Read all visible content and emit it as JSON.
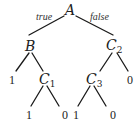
{
  "diagram": {
    "type": "binary-decision-tree",
    "root": "A",
    "edge_labels": [
      {
        "id": "true",
        "text": "true",
        "x": 36,
        "y": 20
      },
      {
        "id": "false",
        "text": "false",
        "x": 90,
        "y": 20
      }
    ],
    "nodes": [
      {
        "id": "A",
        "name": "node-a",
        "letter": "A",
        "sub": "",
        "x": 65,
        "y": 15
      },
      {
        "id": "B",
        "name": "node-b",
        "letter": "B",
        "sub": "",
        "x": 25,
        "y": 51
      },
      {
        "id": "C2",
        "name": "node-c2",
        "letter": "C",
        "sub": "2",
        "x": 106,
        "y": 50
      },
      {
        "id": "C1",
        "name": "node-c1",
        "letter": "C",
        "sub": "1",
        "x": 39,
        "y": 84
      },
      {
        "id": "C3",
        "name": "node-c3",
        "letter": "C",
        "sub": "3",
        "x": 86,
        "y": 84
      }
    ],
    "leaves": [
      {
        "id": "B_true",
        "name": "leaf-b-1",
        "text": "1",
        "x": 9,
        "y": 84
      },
      {
        "id": "C2_false",
        "name": "leaf-c2-0",
        "text": "0",
        "x": 127,
        "y": 84
      },
      {
        "id": "C1_true",
        "name": "leaf-c1-1",
        "text": "1",
        "x": 26,
        "y": 119
      },
      {
        "id": "C1_false",
        "name": "leaf-c1-0",
        "text": "0",
        "x": 62,
        "y": 119
      },
      {
        "id": "C3_true",
        "name": "leaf-c3-1",
        "text": "1",
        "x": 73,
        "y": 119
      },
      {
        "id": "C3_false",
        "name": "leaf-c3-0",
        "text": "0",
        "x": 110,
        "y": 119
      }
    ],
    "edges": [
      {
        "name": "edge-a-b",
        "x1": 64,
        "y1": 16,
        "x2": 29,
        "y2": 35
      },
      {
        "name": "edge-a-c2",
        "x1": 76,
        "y1": 16,
        "x2": 113,
        "y2": 35
      },
      {
        "name": "edge-b-1",
        "x1": 29,
        "y1": 53,
        "x2": 16,
        "y2": 71
      },
      {
        "name": "edge-b-c1",
        "x1": 32,
        "y1": 53,
        "x2": 43,
        "y2": 71
      },
      {
        "name": "edge-c2-c3",
        "x1": 112,
        "y1": 53,
        "x2": 100,
        "y2": 71
      },
      {
        "name": "edge-c2-0",
        "x1": 117,
        "y1": 53,
        "x2": 128,
        "y2": 71
      },
      {
        "name": "edge-c1-1",
        "x1": 43,
        "y1": 86,
        "x2": 31,
        "y2": 106
      },
      {
        "name": "edge-c1-0",
        "x1": 47,
        "y1": 86,
        "x2": 59,
        "y2": 106
      },
      {
        "name": "edge-c3-1",
        "x1": 90,
        "y1": 86,
        "x2": 78,
        "y2": 106
      },
      {
        "name": "edge-c3-0",
        "x1": 94,
        "y1": 86,
        "x2": 106,
        "y2": 106
      }
    ]
  }
}
